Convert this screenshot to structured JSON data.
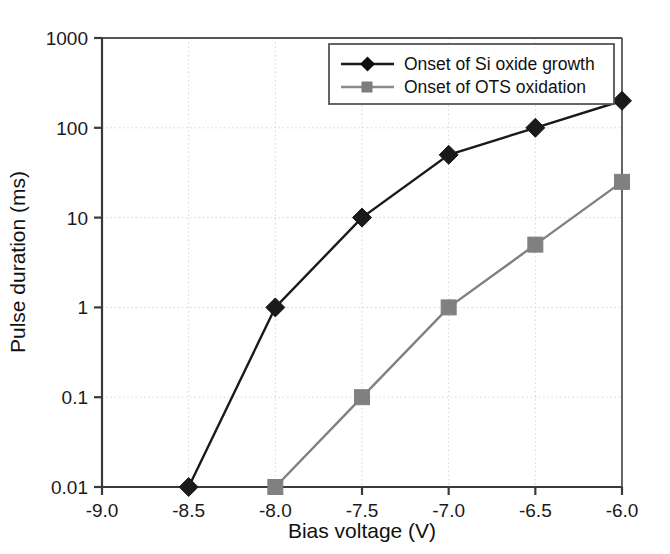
{
  "chart_data": {
    "type": "line",
    "title": "",
    "xlabel": "Bias voltage (V)",
    "ylabel": "Pulse duration (ms)",
    "x": [
      -9.0,
      -8.5,
      -8.0,
      -7.5,
      -7.0,
      -6.5,
      -6.0
    ],
    "xlim": [
      -9.0,
      -6.0
    ],
    "ylim": [
      0.01,
      1000
    ],
    "yscale": "log",
    "xticks": [
      "-9.0",
      "-8.5",
      "-8.0",
      "-7.5",
      "-7.0",
      "-6.5",
      "-6.0"
    ],
    "ytick_values": [
      0.01,
      0.1,
      1,
      10,
      100,
      1000
    ],
    "yticks": [
      "0.01",
      "0.1",
      "1",
      "10",
      "100",
      "1000"
    ],
    "grid": true,
    "legend_position": "upper right inside",
    "series": [
      {
        "name": "Onset of Si oxide growth",
        "color": "#1a1a1a",
        "marker": "diamond",
        "x": [
          -8.5,
          -8.0,
          -7.5,
          -7.0,
          -6.5,
          -6.0
        ],
        "values": [
          0.01,
          1,
          10,
          50,
          100,
          200
        ]
      },
      {
        "name": "Onset of OTS oxidation",
        "color": "#808080",
        "marker": "square",
        "x": [
          -8.0,
          -7.5,
          -7.0,
          -6.5,
          -6.0
        ],
        "values": [
          0.01,
          0.1,
          1,
          5,
          25
        ]
      }
    ]
  },
  "legend": {
    "entries": [
      {
        "label": "Onset of Si oxide growth"
      },
      {
        "label": "Onset of OTS oxidation"
      }
    ]
  },
  "axes": {
    "x_title": "Bias voltage (V)",
    "y_title": "Pulse duration (ms)"
  }
}
